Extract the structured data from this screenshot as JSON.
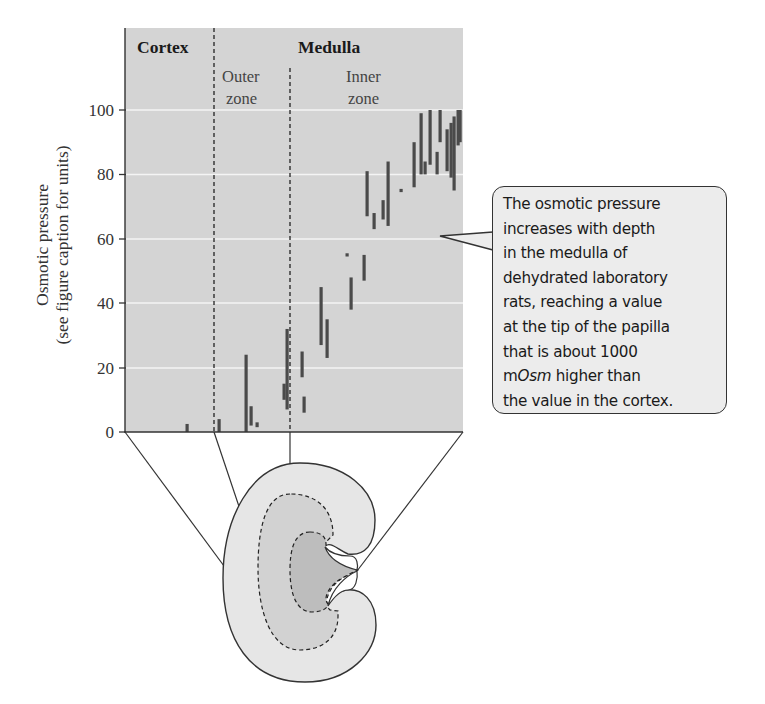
{
  "chart_data": {
    "type": "range-bar",
    "title": "",
    "ylabel": "Osmotic pressure",
    "ylabel_sub": "(see figure caption for units)",
    "xlabel": "",
    "ylim": [
      0,
      100
    ],
    "yticks": [
      0,
      20,
      40,
      60,
      80,
      100
    ],
    "grid": true,
    "regions": [
      {
        "name": "Cortex",
        "x_from": 125,
        "x_to": 214
      },
      {
        "name": "Medulla",
        "sub": [
          {
            "name": "Outer zone",
            "x_from": 214,
            "x_to": 290
          },
          {
            "name": "Inner zone",
            "x_from": 290,
            "x_to": 463
          }
        ]
      }
    ],
    "bars": [
      {
        "x": 187,
        "low": 0,
        "high": 2.5
      },
      {
        "x": 219,
        "low": 0,
        "high": 4
      },
      {
        "x": 246,
        "low": 0,
        "high": 24
      },
      {
        "x": 251,
        "low": 2,
        "high": 8
      },
      {
        "x": 257,
        "low": 1.5,
        "high": 3
      },
      {
        "x": 284,
        "low": 10,
        "high": 15
      },
      {
        "x": 287,
        "low": 7,
        "high": 32
      },
      {
        "x": 302,
        "low": 17,
        "high": 25
      },
      {
        "x": 304,
        "low": 6,
        "high": 11
      },
      {
        "x": 321,
        "low": 27,
        "high": 45
      },
      {
        "x": 327,
        "low": 23,
        "high": 35
      },
      {
        "x": 347,
        "low": 54.5,
        "high": 55.5
      },
      {
        "x": 351,
        "low": 38,
        "high": 48
      },
      {
        "x": 364,
        "low": 47,
        "high": 55
      },
      {
        "x": 367,
        "low": 67,
        "high": 81
      },
      {
        "x": 374,
        "low": 63,
        "high": 68
      },
      {
        "x": 383,
        "low": 66,
        "high": 72
      },
      {
        "x": 388,
        "low": 64,
        "high": 84
      },
      {
        "x": 401,
        "low": 74.5,
        "high": 75.5
      },
      {
        "x": 414,
        "low": 76,
        "high": 90
      },
      {
        "x": 421,
        "low": 80,
        "high": 99
      },
      {
        "x": 425,
        "low": 80,
        "high": 84
      },
      {
        "x": 430,
        "low": 83,
        "high": 100
      },
      {
        "x": 437,
        "low": 80,
        "high": 87
      },
      {
        "x": 440,
        "low": 90,
        "high": 100
      },
      {
        "x": 447,
        "low": 81,
        "high": 94
      },
      {
        "x": 451,
        "low": 79,
        "high": 96
      },
      {
        "x": 454,
        "low": 75,
        "high": 98
      },
      {
        "x": 458,
        "low": 89,
        "high": 100
      },
      {
        "x": 460,
        "low": 90,
        "high": 100
      }
    ],
    "annotation": "The osmotic pressure increases with depth in the medulla of dehydrated laboratory rats, reaching a value at the tip of the papilla that is about 1000 mOsm higher than the value in the cortex."
  },
  "labels": {
    "cortex": "Cortex",
    "medulla": "Medulla",
    "outer1": "Outer",
    "outer2": "zone",
    "inner1": "Inner",
    "inner2": "zone",
    "ylabel": "Osmotic pressure",
    "ylabel_sub": "(see figure caption for units)",
    "ticks": [
      "0",
      "20",
      "40",
      "60",
      "80",
      "100"
    ]
  },
  "bubble": {
    "lines": [
      "The osmotic pressure",
      "increases with depth",
      "in the medulla of",
      "dehydrated laboratory",
      "rats, reaching a value",
      "at the tip of the papilla",
      "that is about 1000"
    ],
    "line8_pre": "m",
    "line8_em": "Osm",
    "line8_post": " higher than",
    "line9": "the value in the cortex."
  },
  "colors": {
    "plot_bg": "#d4d4d4",
    "grid": "#f4f4f4",
    "bar": "#4a4a4a",
    "kidney_cortex": "#e6e6e6",
    "kidney_outer_medulla": "#d2d2d2",
    "kidney_inner_medulla": "#bdbdbd"
  }
}
